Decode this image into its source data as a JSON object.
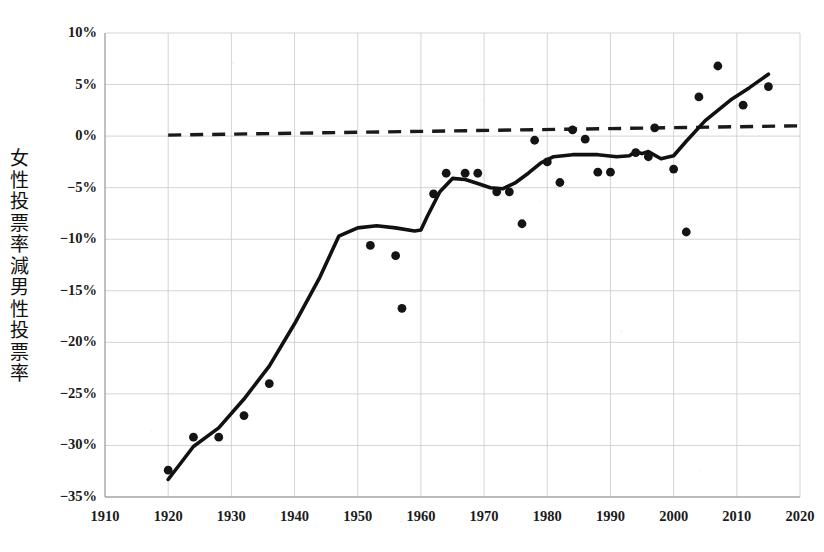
{
  "chart_data": {
    "type": "scatter",
    "title": "",
    "subtitle": "",
    "xlabel": "",
    "ylabel": "女性投票率減男性投票率",
    "xlim": [
      1910,
      2020
    ],
    "ylim": [
      -35,
      10
    ],
    "xticks": [
      1910,
      1920,
      1930,
      1940,
      1950,
      1960,
      1970,
      1980,
      1990,
      2000,
      2010,
      2020
    ],
    "xtick_labels": [
      "1910",
      "1920",
      "1930",
      "1940",
      "1950",
      "1960",
      "1970",
      "1980",
      "1990",
      "2000",
      "2010",
      "2020"
    ],
    "yticks": [
      10,
      5,
      0,
      -5,
      -10,
      -15,
      -20,
      -25,
      -30,
      -35
    ],
    "ytick_labels": [
      "10%",
      "5%",
      "0%",
      "−5%",
      "−10%",
      "−15%",
      "−20%",
      "−25%",
      "−30%",
      "−35%"
    ],
    "grid": true,
    "legend": "none",
    "series": [
      {
        "name": "observations",
        "type": "scatter",
        "marker": "circle",
        "color": "#141414",
        "points": [
          {
            "x": 1920,
            "y": -32.4
          },
          {
            "x": 1924,
            "y": -29.2
          },
          {
            "x": 1928,
            "y": -29.2
          },
          {
            "x": 1932,
            "y": -27.1
          },
          {
            "x": 1936,
            "y": -24.0
          },
          {
            "x": 1952,
            "y": -10.6
          },
          {
            "x": 1956,
            "y": -11.6
          },
          {
            "x": 1957,
            "y": -16.7
          },
          {
            "x": 1962,
            "y": -5.6
          },
          {
            "x": 1964,
            "y": -3.6
          },
          {
            "x": 1967,
            "y": -3.6
          },
          {
            "x": 1969,
            "y": -3.6
          },
          {
            "x": 1972,
            "y": -5.4
          },
          {
            "x": 1974,
            "y": -5.4
          },
          {
            "x": 1976,
            "y": -8.5
          },
          {
            "x": 1978,
            "y": -0.4
          },
          {
            "x": 1980,
            "y": -2.5
          },
          {
            "x": 1982,
            "y": -4.5
          },
          {
            "x": 1984,
            "y": 0.6
          },
          {
            "x": 1986,
            "y": -0.3
          },
          {
            "x": 1988,
            "y": -3.5
          },
          {
            "x": 1990,
            "y": -3.5
          },
          {
            "x": 1994,
            "y": -1.6
          },
          {
            "x": 1996,
            "y": -2.0
          },
          {
            "x": 1997,
            "y": 0.8
          },
          {
            "x": 2000,
            "y": -3.2
          },
          {
            "x": 2002,
            "y": -9.3
          },
          {
            "x": 2004,
            "y": 3.8
          },
          {
            "x": 2007,
            "y": 6.8
          },
          {
            "x": 2011,
            "y": 3.0
          },
          {
            "x": 2015,
            "y": 4.8
          }
        ]
      },
      {
        "name": "smoothed-trend",
        "type": "line",
        "color": "#111111",
        "style": "solid",
        "points": [
          {
            "x": 1920,
            "y": -33.3
          },
          {
            "x": 1924,
            "y": -30.1
          },
          {
            "x": 1928,
            "y": -28.3
          },
          {
            "x": 1932,
            "y": -25.5
          },
          {
            "x": 1936,
            "y": -22.3
          },
          {
            "x": 1940,
            "y": -18.2
          },
          {
            "x": 1944,
            "y": -13.7
          },
          {
            "x": 1947,
            "y": -9.7
          },
          {
            "x": 1950,
            "y": -8.9
          },
          {
            "x": 1953,
            "y": -8.7
          },
          {
            "x": 1956,
            "y": -8.9
          },
          {
            "x": 1959,
            "y": -9.2
          },
          {
            "x": 1960,
            "y": -9.1
          },
          {
            "x": 1961,
            "y": -7.8
          },
          {
            "x": 1963,
            "y": -5.4
          },
          {
            "x": 1965,
            "y": -4.1
          },
          {
            "x": 1967,
            "y": -4.2
          },
          {
            "x": 1969,
            "y": -4.6
          },
          {
            "x": 1971,
            "y": -5.0
          },
          {
            "x": 1973,
            "y": -5.1
          },
          {
            "x": 1975,
            "y": -4.5
          },
          {
            "x": 1977,
            "y": -3.6
          },
          {
            "x": 1979,
            "y": -2.6
          },
          {
            "x": 1981,
            "y": -2.0
          },
          {
            "x": 1984,
            "y": -1.8
          },
          {
            "x": 1988,
            "y": -1.8
          },
          {
            "x": 1991,
            "y": -2.0
          },
          {
            "x": 1993,
            "y": -1.9
          },
          {
            "x": 1994,
            "y": -1.5
          },
          {
            "x": 1995,
            "y": -1.7
          },
          {
            "x": 1996,
            "y": -1.5
          },
          {
            "x": 1998,
            "y": -2.2
          },
          {
            "x": 2000,
            "y": -1.9
          },
          {
            "x": 2002,
            "y": -0.5
          },
          {
            "x": 2005,
            "y": 1.5
          },
          {
            "x": 2009,
            "y": 3.5
          },
          {
            "x": 2012,
            "y": 4.7
          },
          {
            "x": 2015,
            "y": 6.0
          }
        ]
      },
      {
        "name": "zero-reference",
        "type": "line",
        "color": "#1a1a1a",
        "style": "dashed",
        "points": [
          {
            "x": 1920,
            "y": 0.1
          },
          {
            "x": 2020,
            "y": 1.0
          }
        ]
      }
    ]
  },
  "axis": {
    "y_label_chars": "女性投票率減男性投票率"
  }
}
